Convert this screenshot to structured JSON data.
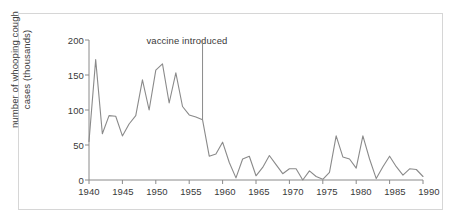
{
  "chart_data": {
    "type": "line",
    "title": "",
    "xlabel": "",
    "ylabel": "number of whooping cough\ncases (thousands)",
    "xlim": [
      1940,
      1990
    ],
    "ylim": [
      0,
      200
    ],
    "grid": false,
    "legend": null,
    "line_color": "#8a8a8a",
    "axis_color": "#8a8a8a",
    "text_color": "#3a3a3a",
    "frame_color": "#d6d6d6",
    "background": "#ffffff",
    "xticks": [
      1940,
      1945,
      1950,
      1955,
      1960,
      1965,
      1970,
      1975,
      1980,
      1985,
      1990
    ],
    "xtick_labels": [
      "1940",
      "1945",
      "1950",
      "1955",
      "1960",
      "1965",
      "1970",
      "1975",
      "1980",
      "1985",
      "1990"
    ],
    "yticks": [
      0,
      50,
      100,
      150,
      200
    ],
    "ytick_labels": [
      "0",
      "50",
      "100",
      "150",
      "200"
    ],
    "annotations": [
      {
        "name": "vaccine-introduced",
        "label": "vaccine introduced",
        "x": 1957,
        "line_from_y": 200,
        "line_to_y": 86,
        "label_x": 1948.6,
        "label_y": 196
      }
    ],
    "x": [
      1940,
      1941,
      1942,
      1943,
      1944,
      1945,
      1946,
      1947,
      1948,
      1949,
      1950,
      1951,
      1952,
      1953,
      1954,
      1955,
      1956,
      1957,
      1958,
      1959,
      1960,
      1961,
      1962,
      1963,
      1964,
      1965,
      1966,
      1967,
      1968,
      1969,
      1970,
      1971,
      1972,
      1973,
      1974,
      1975,
      1976,
      1977,
      1978,
      1979,
      1980,
      1981,
      1982,
      1983,
      1984,
      1985,
      1986,
      1987,
      1988,
      1989,
      1990
    ],
    "values": [
      55,
      172,
      66,
      92,
      91,
      63,
      80,
      92,
      143,
      100,
      157,
      166,
      110,
      153,
      105,
      93,
      90,
      86,
      34,
      37,
      54,
      25,
      3,
      30,
      34,
      6,
      18,
      35,
      22,
      9,
      16,
      16,
      0,
      13,
      5,
      1,
      11,
      63,
      33,
      30,
      17,
      63,
      30,
      2,
      19,
      34,
      19,
      7,
      16,
      15,
      5
    ],
    "series_name": "whooping cough cases"
  }
}
